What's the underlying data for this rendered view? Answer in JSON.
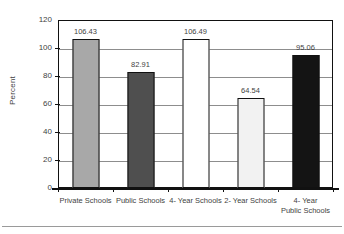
{
  "chart_data": {
    "type": "bar",
    "title": "",
    "subtitle": "",
    "xlabel": "",
    "ylabel": "Percent",
    "ylim": [
      0,
      120
    ],
    "yticks": [
      0,
      20,
      40,
      60,
      80,
      100,
      120
    ],
    "ytick_labels": [
      "0",
      "20",
      "40",
      "60",
      "80",
      "100",
      "120"
    ],
    "grid": true,
    "legend": "none",
    "categories": [
      "Private Schools",
      "Public Schools",
      "4- Year Schools",
      "2- Year Schools",
      "4- Year\nPublic Schools"
    ],
    "values": [
      106.43,
      82.91,
      106.49,
      64.54,
      95.06
    ],
    "value_labels": [
      "106.43",
      "82.91",
      "106.49",
      "64.54",
      "95.06"
    ],
    "bar_colors": [
      "#a8a8a8",
      "#4f4f4f",
      "#ffffff",
      "#f2f2f2",
      "#141414"
    ],
    "bar_edge_color": "#111111"
  },
  "axes": {
    "y_title": "Percent"
  }
}
